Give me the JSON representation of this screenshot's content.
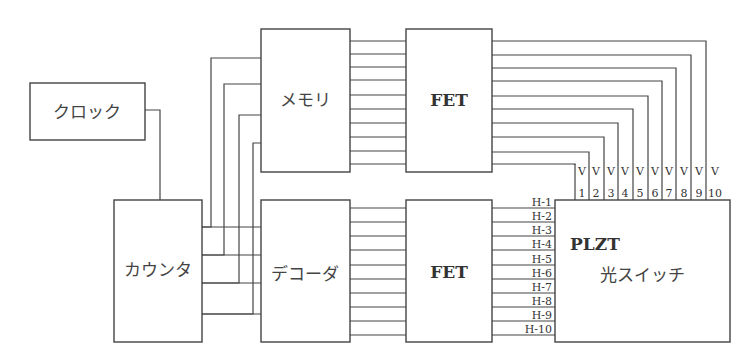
{
  "diagram": {
    "type": "block-diagram",
    "blocks": {
      "clock": "クロック",
      "counter": "カウンタ",
      "memory": "メモリ",
      "decoder": "デコーダ",
      "fet_top": "FET",
      "fet_bottom": "FET",
      "switch_line1": "PLZT",
      "switch_line2": "光スイッチ"
    },
    "v_labels": [
      {
        "letter": "V",
        "num": "1"
      },
      {
        "letter": "V",
        "num": "2"
      },
      {
        "letter": "V",
        "num": "3"
      },
      {
        "letter": "V",
        "num": "4"
      },
      {
        "letter": "V",
        "num": "5"
      },
      {
        "letter": "V",
        "num": "6"
      },
      {
        "letter": "V",
        "num": "7"
      },
      {
        "letter": "V",
        "num": "8"
      },
      {
        "letter": "V",
        "num": "9"
      },
      {
        "letter": "V",
        "num": "10"
      }
    ],
    "h_labels": [
      "H-1",
      "H-2",
      "H-3",
      "H-4",
      "H-5",
      "H-6",
      "H-7",
      "H-8",
      "H-9",
      "H-10"
    ],
    "connections": [
      "clock -> counter",
      "counter -> memory (4 lines)",
      "counter -> decoder (4 lines)",
      "memory -> fet_top (10 lines)",
      "decoder -> fet_bottom (10 lines)",
      "fet_top -> PLZT V1..V10",
      "fet_bottom -> PLZT H-1..H-10"
    ]
  }
}
